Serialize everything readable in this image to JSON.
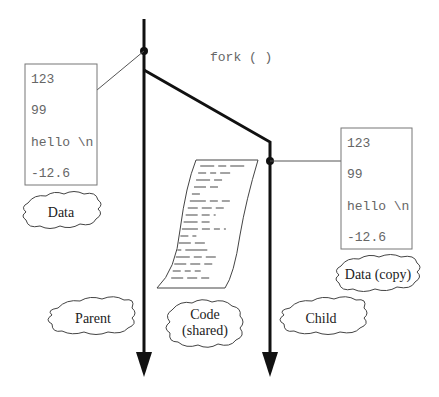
{
  "diagram": {
    "fork_label": "fork ( )",
    "parent_data": {
      "values": [
        "123",
        "99",
        "hello \\n",
        "-12.6"
      ],
      "label": "Data"
    },
    "child_data": {
      "values": [
        "123",
        "99",
        "hello \\n",
        "-12.6"
      ],
      "label": "Data (copy)"
    },
    "parent_label": "Parent",
    "child_label": "Child",
    "code_label_line1": "Code",
    "code_label_line2": "(shared)"
  }
}
